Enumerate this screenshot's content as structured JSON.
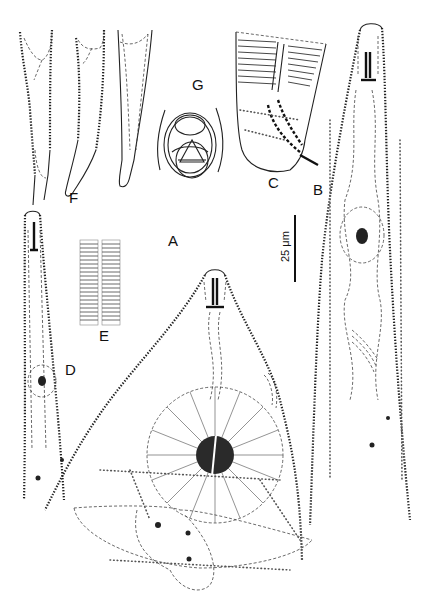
{
  "figure": {
    "panel_labels": {
      "A": "A",
      "B": "B",
      "C": "C",
      "D": "D",
      "E": "E",
      "F": "F",
      "G": "G"
    },
    "scale_bar": {
      "label": "25 μm",
      "orientation": "vertical"
    },
    "panels": [
      {
        "id": "A",
        "description": "anterior region, large view with nerve ring and cephalic structures"
      },
      {
        "id": "B",
        "description": "anterior body, elongate view"
      },
      {
        "id": "C",
        "description": "tail/posterior end with spicule"
      },
      {
        "id": "D",
        "description": "anterior body, smaller view"
      },
      {
        "id": "E",
        "description": "cuticle striations"
      },
      {
        "id": "F",
        "description": "three tail variants"
      },
      {
        "id": "G",
        "description": "en face / cross-section view"
      }
    ]
  }
}
